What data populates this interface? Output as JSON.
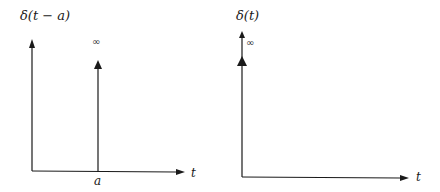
{
  "diagram": {
    "stroke_color": "#1a1a1a",
    "background": "#ffffff",
    "panels": [
      {
        "id": "shifted-impulse",
        "title": "δ(t − a)",
        "x_axis_label": "t",
        "impulse_label": "∞",
        "impulse_position_label": "a"
      },
      {
        "id": "unit-impulse",
        "title": "δ(t)",
        "x_axis_label": "t",
        "impulse_label": "∞"
      }
    ]
  }
}
